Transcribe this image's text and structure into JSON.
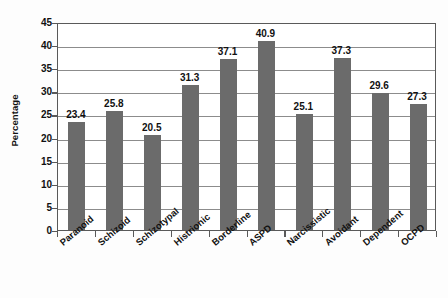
{
  "chart_data": {
    "type": "bar",
    "title": "",
    "subtitle": "",
    "xlabel": "",
    "ylabel": "Percentage",
    "ylim": [
      0,
      45
    ],
    "ytick_labels": [
      "0",
      "5",
      "10",
      "15",
      "20",
      "25",
      "30",
      "35",
      "40",
      "45"
    ],
    "ytick_values": [
      0,
      5,
      10,
      15,
      20,
      25,
      30,
      35,
      40,
      45
    ],
    "grid": true,
    "legend": "none",
    "bar_color": "#6b6b6b",
    "axis_color": "#595959",
    "grid_color": "#8c8c8c",
    "categories": [
      "Paranoid",
      "Schizoid",
      "Schizotypal",
      "Histrionic",
      "Borderline",
      "ASPD",
      "Narcissistic",
      "Avoidant",
      "Dependent",
      "OCPD"
    ],
    "values": [
      23.4,
      25.8,
      20.5,
      31.3,
      37.1,
      40.9,
      25.1,
      37.3,
      29.6,
      27.3
    ],
    "data_labels": [
      "23.4",
      "25.8",
      "20.5",
      "31.3",
      "37.1",
      "40.9",
      "25.1",
      "37.3",
      "29.6",
      "27.3"
    ]
  }
}
